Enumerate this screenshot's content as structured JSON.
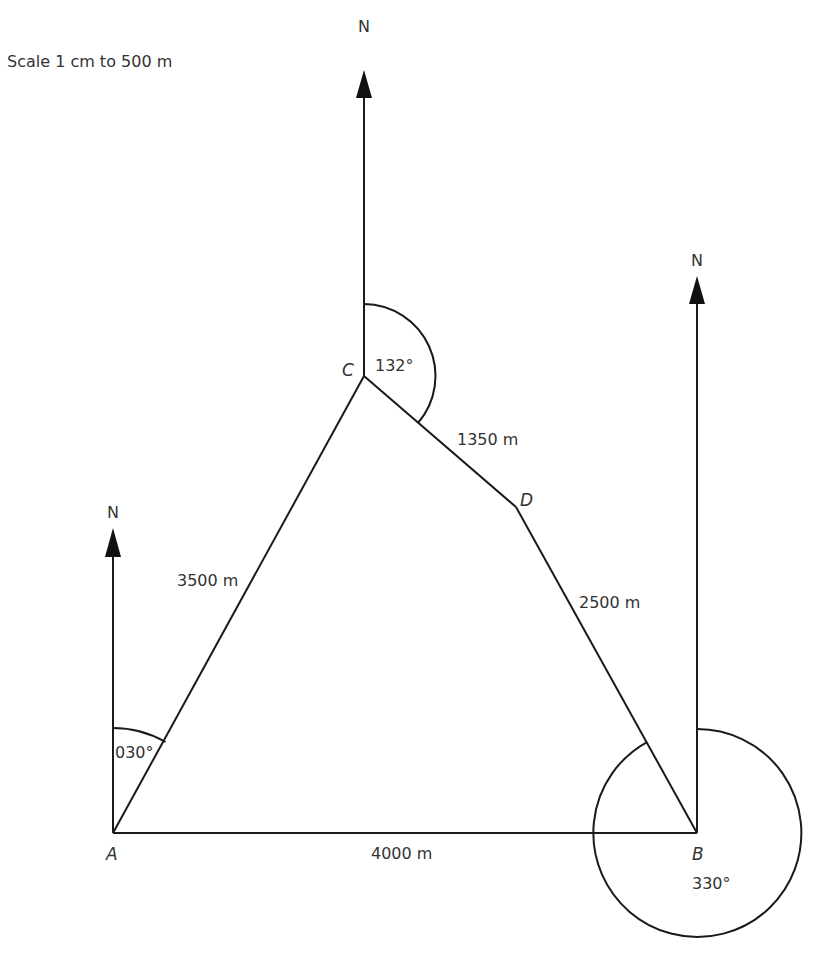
{
  "scale": {
    "text": "Scale 1 cm to 500 m"
  },
  "points": {
    "A": {
      "label": "A"
    },
    "B": {
      "label": "B"
    },
    "C": {
      "label": "C"
    },
    "D": {
      "label": "D"
    }
  },
  "north_arrows": {
    "at_A": {
      "label": "N"
    },
    "at_B": {
      "label": "N"
    },
    "at_C": {
      "label": "N"
    }
  },
  "distances": {
    "AC": "3500 m",
    "CD": "1350 m",
    "DB": "2500 m",
    "AB": "4000 m"
  },
  "bearings": {
    "A": "030°",
    "C": "132°",
    "B": "330°"
  },
  "colors": {
    "line": "#1a1a1a",
    "text": "#333333",
    "background": "#ffffff"
  }
}
